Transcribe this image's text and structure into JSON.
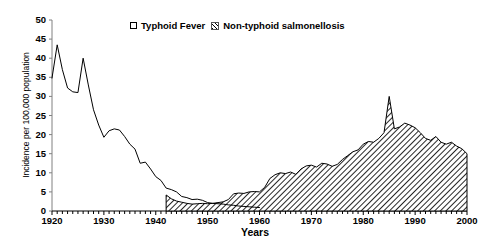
{
  "chart_data": {
    "type": "area",
    "title": "",
    "xlabel": "Years",
    "ylabel": "Incidence per 100,000 population",
    "xlim": [
      1920,
      2000
    ],
    "ylim": [
      0,
      50
    ],
    "ytick_step": 5,
    "yticks": [
      0,
      5,
      10,
      15,
      20,
      25,
      30,
      35,
      40,
      45,
      50
    ],
    "xticks": [
      1920,
      1930,
      1940,
      1950,
      1960,
      1970,
      1980,
      1990,
      2000
    ],
    "xtick_minor_step": 1,
    "grid": false,
    "legend_position": "top-center",
    "series": [
      {
        "name": "Typhoid Fever",
        "render": "line",
        "color": "#000000",
        "x": [
          1920,
          1921,
          1922,
          1923,
          1924,
          1925,
          1926,
          1927,
          1928,
          1929,
          1930,
          1931,
          1932,
          1933,
          1934,
          1935,
          1936,
          1937,
          1938,
          1939,
          1940,
          1941,
          1942,
          1943,
          1944,
          1945,
          1946,
          1947,
          1948,
          1949,
          1950,
          1951,
          1952,
          1953,
          1954,
          1955,
          1956,
          1957,
          1958,
          1959,
          1960
        ],
        "values": [
          34.8,
          43.5,
          37.0,
          32.2,
          31.2,
          31.0,
          40.0,
          33.0,
          26.5,
          22.5,
          19.3,
          21.0,
          21.5,
          21.2,
          19.5,
          17.5,
          16.2,
          12.5,
          12.8,
          11.0,
          9.0,
          8.0,
          6.0,
          5.6,
          5.0,
          3.8,
          3.5,
          3.0,
          3.1,
          2.8,
          2.2,
          2.0,
          1.9,
          1.8,
          1.6,
          1.5,
          1.3,
          1.2,
          1.1,
          1.0,
          0.9
        ]
      },
      {
        "name": "Non-typhoid salmonellosis",
        "render": "area-hatched",
        "color": "#000000",
        "fill": "diagonal-hatch",
        "x": [
          1942,
          1943,
          1944,
          1945,
          1946,
          1947,
          1948,
          1949,
          1950,
          1951,
          1952,
          1953,
          1954,
          1955,
          1956,
          1957,
          1958,
          1959,
          1960,
          1961,
          1962,
          1963,
          1964,
          1965,
          1966,
          1967,
          1968,
          1969,
          1970,
          1971,
          1972,
          1973,
          1974,
          1975,
          1976,
          1977,
          1978,
          1979,
          1980,
          1981,
          1982,
          1983,
          1984,
          1985,
          1986,
          1987,
          1988,
          1989,
          1990,
          1991,
          1992,
          1993,
          1994,
          1995,
          1996,
          1997,
          1998,
          1999,
          2000
        ],
        "values": [
          4.2,
          3.2,
          2.6,
          2.3,
          2.0,
          1.8,
          1.9,
          2.0,
          1.9,
          2.0,
          2.2,
          2.4,
          3.0,
          4.5,
          4.7,
          4.6,
          5.0,
          5.1,
          5.0,
          6.2,
          8.5,
          9.5,
          10.0,
          9.8,
          10.2,
          9.6,
          11.0,
          11.8,
          12.0,
          11.5,
          12.5,
          12.3,
          11.7,
          12.2,
          13.5,
          14.5,
          15.5,
          16.0,
          17.5,
          18.2,
          18.0,
          19.0,
          20.5,
          30.0,
          21.5,
          22.0,
          23.0,
          22.5,
          21.8,
          20.5,
          19.0,
          18.5,
          19.5,
          18.0,
          17.5,
          18.0,
          17.0,
          16.3,
          15.0
        ]
      }
    ]
  },
  "legend": {
    "entries": [
      {
        "label": "Typhoid Fever",
        "marker": "open-square-marker"
      },
      {
        "label": "Non-typhoid salmonellosis",
        "marker": "hatch-swatch-marker"
      }
    ]
  },
  "axes": {
    "y_title": "Incidence per 100,000 population",
    "x_title": "Years",
    "y_tick_labels": [
      "50",
      "45",
      "40",
      "35",
      "30",
      "25",
      "20",
      "15",
      "10",
      "5",
      "0"
    ],
    "x_tick_labels": [
      "1920",
      "1930",
      "1940",
      "1950",
      "1960",
      "1970",
      "1980",
      "1990",
      "2000"
    ]
  },
  "colors": {
    "line": "#000000",
    "hatch": "#000000",
    "axis": "#000000",
    "background": "#ffffff"
  }
}
